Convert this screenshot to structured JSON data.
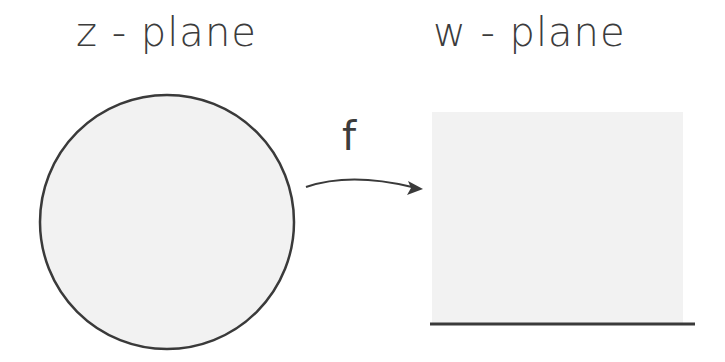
{
  "diagram": {
    "domain_label": "z - plane",
    "codomain_label": "w - plane",
    "map_label": "f",
    "domain_shape": {
      "type": "disk",
      "cx": 167,
      "cy": 222,
      "r": 127,
      "fill": "#f2f2f2",
      "stroke": "#3a3a3a"
    },
    "codomain_shape": {
      "type": "half-plane",
      "x": 432,
      "y": 112,
      "width": 251,
      "height": 211,
      "fill": "#f2f2f2",
      "boundary_line": {
        "x1": 430,
        "x2": 695,
        "y": 324,
        "stroke": "#3a3a3a"
      }
    },
    "arrow": {
      "from": "disk",
      "to": "half-plane",
      "stroke": "#3a3a3a"
    }
  }
}
